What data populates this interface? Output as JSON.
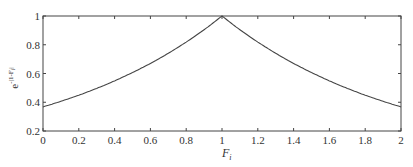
{
  "chart_data": {
    "type": "line",
    "title": "",
    "xlabel": "F_i",
    "ylabel": "e^{-|1-F_i|}",
    "xlim": [
      0,
      2
    ],
    "ylim": [
      0.2,
      1
    ],
    "xticks": [
      "0",
      "0.2",
      "0.4",
      "0.6",
      "0.8",
      "1",
      "1.2",
      "1.4",
      "1.6",
      "1.8",
      "2"
    ],
    "yticks": [
      "0.2",
      "0.4",
      "0.6",
      "0.8",
      "1"
    ],
    "grid": false,
    "series": [
      {
        "name": "e^{-|1-F_i|}",
        "x": [
          0,
          0.2,
          0.4,
          0.6,
          0.8,
          1.0,
          1.2,
          1.4,
          1.6,
          1.8,
          2.0
        ],
        "values": [
          0.368,
          0.449,
          0.549,
          0.67,
          0.819,
          1.0,
          0.819,
          0.67,
          0.549,
          0.449,
          0.368
        ]
      }
    ]
  },
  "labels": {
    "xlabel_main": "F",
    "xlabel_sub": "i",
    "ylabel_base": "e",
    "ylabel_exp": "-|1-F",
    "ylabel_exp_sub": "i",
    "ylabel_exp_end": "|"
  }
}
